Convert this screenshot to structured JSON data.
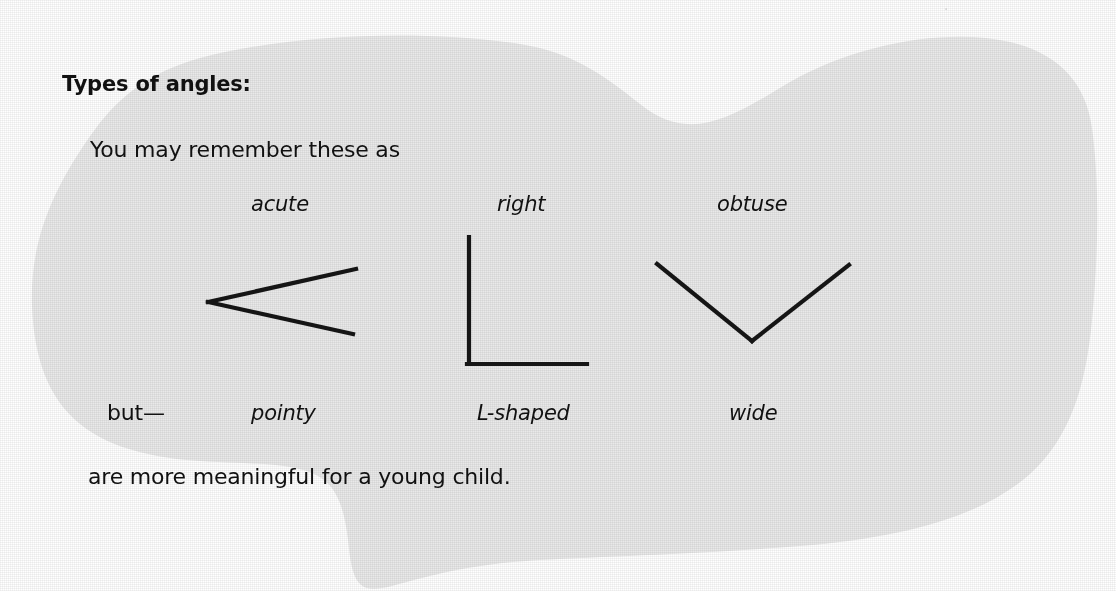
{
  "page": {
    "width": 1116,
    "height": 591,
    "paper_color": "#e9e9e9",
    "ink_color": "#111111",
    "background_color": "#ffffff"
  },
  "content": {
    "heading": "Types of angles:",
    "intro_line": "You may remember these as",
    "but_word": "but—",
    "closing_line": "are more meaningful for a young child.",
    "formal_labels": [
      {
        "text": "acute",
        "style": "italic"
      },
      {
        "text": "right",
        "style": "italic"
      },
      {
        "text": "obtuse",
        "style": "italic"
      }
    ],
    "child_labels": [
      {
        "text": "pointy",
        "style": "italic"
      },
      {
        "text": "L-shaped",
        "style": "italic"
      },
      {
        "text": "wide",
        "style": "italic"
      }
    ]
  },
  "figures": [
    {
      "name": "acute-angle",
      "description": "acute angle, vertex at left, opening to the right",
      "vertex": [
        208,
        302
      ],
      "rays": [
        [
          356,
          269
        ],
        [
          353,
          334
        ]
      ]
    },
    {
      "name": "right-angle",
      "description": "right angle drawn as an L shape",
      "vertex": [
        469,
        364
      ],
      "rays": [
        [
          469,
          237
        ],
        [
          587,
          364
        ]
      ]
    },
    {
      "name": "obtuse-angle",
      "description": "obtuse angle drawn as a wide V",
      "vertex": [
        752,
        341
      ],
      "rays": [
        [
          657,
          264
        ],
        [
          849,
          265
        ]
      ]
    }
  ],
  "artifacts": {
    "scan_speck": "·"
  }
}
